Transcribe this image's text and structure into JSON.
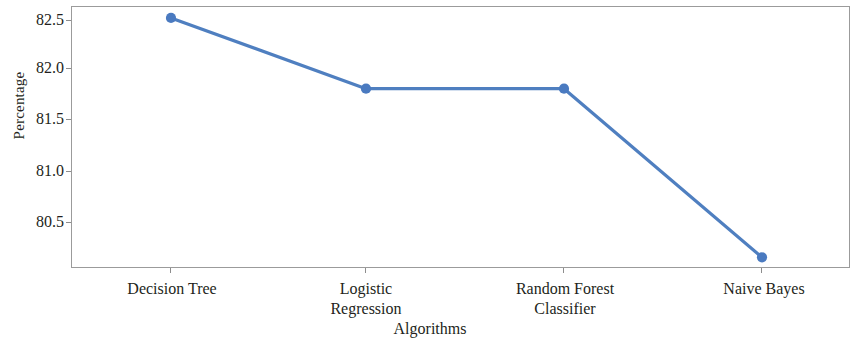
{
  "chart_data": {
    "type": "line",
    "title": "",
    "subtitle": "",
    "xlabel": "Algorithms",
    "ylabel": "Percentage",
    "categories": [
      "Decision Tree",
      "Logistic Regression",
      "Random Forest Classifier",
      "Naive Bayes"
    ],
    "category_lines": [
      [
        "Decision Tree"
      ],
      [
        "Logistic",
        "Regression"
      ],
      [
        "Random Forest",
        "Classifier"
      ],
      [
        "Naive Bayes"
      ]
    ],
    "values": [
      82.53,
      81.83,
      81.83,
      80.16
    ],
    "series": [
      {
        "name": "Percentage",
        "values": [
          82.53,
          81.83,
          81.83,
          80.16
        ]
      }
    ],
    "ytick_labels": [
      "82.5",
      "82.0",
      "81.5",
      "81.0",
      "80.5"
    ],
    "ytick_values": [
      82.5,
      82.0,
      81.5,
      81.0,
      80.5
    ],
    "ylim": [
      80.05,
      82.63
    ],
    "grid": false,
    "legend": false,
    "legend_position": "none",
    "line_color": "#4f7fc0",
    "marker_color": "#4a7ac0",
    "marker_shape": "circle",
    "frame_color": "#9b9b9b",
    "background_color": "#ffffff",
    "text_color": "#231f20"
  }
}
